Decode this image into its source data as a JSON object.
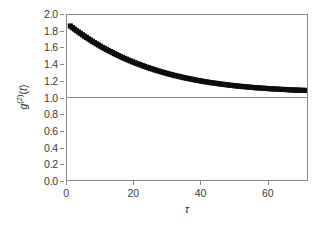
{
  "chart_data": {
    "type": "scatter",
    "title": "",
    "xlabel": "τ",
    "ylabel_parts": {
      "g": "g",
      "sup": "(2)",
      "arg": "(t)"
    },
    "ylabel": "g(2)(t)",
    "xlim": [
      0,
      72
    ],
    "ylim": [
      0.0,
      2.0
    ],
    "xticks": [
      0,
      20,
      40,
      60
    ],
    "xtick_labels": [
      "0",
      "20",
      "40",
      "60"
    ],
    "yticks": [
      0.0,
      0.2,
      0.4,
      0.6,
      0.8,
      1.0,
      1.2,
      1.4,
      1.6,
      1.8,
      2.0
    ],
    "ytick_labels": [
      "0.0",
      "0.2",
      "0.4",
      "0.6",
      "0.8",
      "1.0",
      "1.2",
      "1.4",
      "1.6",
      "1.8",
      "2.0"
    ],
    "grid": false,
    "legend": null,
    "marker": "square",
    "marker_color": "#0d0d0d",
    "marker_size": 2.6,
    "frame_color": "#8a8a8a",
    "background": "#ffffff",
    "reference_lines": [
      {
        "axis": "y",
        "value": 1.0,
        "color": "#8a8a8a",
        "width": 1
      }
    ],
    "baseline": 1.02,
    "amplitude": 0.86,
    "decay_constant": 17.5,
    "x": [
      1.0,
      1.6,
      2.2,
      2.8,
      3.4,
      4.0,
      4.6,
      5.2,
      5.8,
      6.4,
      7.0,
      7.6,
      8.2,
      8.8,
      9.4,
      10.0,
      10.6,
      11.2,
      11.8,
      12.4,
      13.0,
      13.6,
      14.2,
      14.8,
      15.4,
      16.0,
      16.6,
      17.2,
      17.8,
      18.4,
      19.0,
      19.6,
      20.2,
      20.8,
      21.4,
      22.0,
      22.6,
      23.2,
      23.8,
      24.4,
      25.0,
      25.6,
      26.2,
      26.8,
      27.4,
      28.0,
      28.6,
      29.2,
      29.8,
      30.4,
      31.0,
      31.6,
      32.2,
      32.8,
      33.4,
      34.0,
      34.6,
      35.2,
      35.8,
      36.4,
      37.0,
      37.6,
      38.2,
      38.8,
      39.4,
      40.0,
      40.6,
      41.2,
      41.8,
      42.4,
      43.0,
      43.6,
      44.2,
      44.8,
      45.4,
      46.0,
      46.6,
      47.2,
      47.8,
      48.4,
      49.0,
      49.6,
      50.2,
      50.8,
      51.4,
      52.0,
      52.6,
      53.2,
      53.8,
      54.4,
      55.0,
      55.6,
      56.2,
      56.8,
      57.4,
      58.0,
      58.6,
      59.2,
      59.8,
      60.4,
      61.0,
      61.6,
      62.2,
      62.8,
      63.4,
      64.0,
      64.6,
      65.2,
      65.8,
      66.4,
      67.0,
      67.6,
      68.2,
      68.8,
      69.4,
      70.0,
      70.6,
      71.2,
      71.8
    ],
    "y": [
      1.867,
      1.848,
      1.83,
      1.812,
      1.795,
      1.778,
      1.761,
      1.744,
      1.728,
      1.712,
      1.697,
      1.681,
      1.666,
      1.652,
      1.637,
      1.623,
      1.609,
      1.596,
      1.583,
      1.57,
      1.557,
      1.545,
      1.532,
      1.521,
      1.509,
      1.497,
      1.486,
      1.475,
      1.465,
      1.454,
      1.444,
      1.434,
      1.424,
      1.414,
      1.405,
      1.396,
      1.387,
      1.378,
      1.369,
      1.361,
      1.353,
      1.345,
      1.337,
      1.329,
      1.322,
      1.315,
      1.308,
      1.301,
      1.294,
      1.287,
      1.281,
      1.275,
      1.268,
      1.262,
      1.257,
      1.251,
      1.245,
      1.24,
      1.235,
      1.23,
      1.225,
      1.22,
      1.215,
      1.21,
      1.206,
      1.201,
      1.197,
      1.193,
      1.189,
      1.185,
      1.181,
      1.178,
      1.174,
      1.171,
      1.167,
      1.164,
      1.161,
      1.158,
      1.155,
      1.152,
      1.149,
      1.146,
      1.143,
      1.141,
      1.138,
      1.136,
      1.133,
      1.131,
      1.129,
      1.127,
      1.124,
      1.122,
      1.12,
      1.118,
      1.117,
      1.115,
      1.113,
      1.111,
      1.11,
      1.108,
      1.106,
      1.105,
      1.103,
      1.102,
      1.101,
      1.099,
      1.098,
      1.097,
      1.096,
      1.094,
      1.093,
      1.092,
      1.091,
      1.09,
      1.089,
      1.088,
      1.087,
      1.086,
      1.086
    ]
  }
}
